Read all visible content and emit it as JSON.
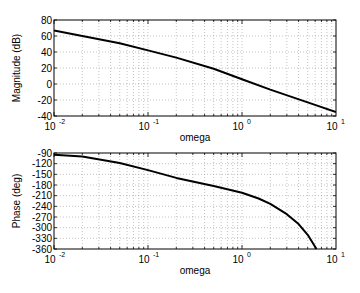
{
  "chart_data": [
    {
      "type": "line",
      "title": "",
      "xlabel": "omega",
      "ylabel": "Magnitude (dB)",
      "xscale": "log",
      "xlim": [
        0.01,
        10
      ],
      "ylim": [
        -40,
        80
      ],
      "grid": true,
      "xticks": [
        "10^-2",
        "10^-1",
        "10^0",
        "10^1"
      ],
      "yticks": [
        80,
        60,
        40,
        20,
        0,
        -20,
        -40
      ],
      "series": [
        {
          "name": "Magnitude",
          "x": [
            0.01,
            0.02,
            0.05,
            0.1,
            0.2,
            0.5,
            1,
            2,
            5,
            10
          ],
          "y": [
            67,
            60,
            51,
            42,
            33,
            19,
            6,
            -7,
            -23,
            -35
          ]
        }
      ]
    },
    {
      "type": "line",
      "title": "",
      "xlabel": "omega",
      "ylabel": "Phase (deg)",
      "xscale": "log",
      "xlim": [
        0.01,
        10
      ],
      "ylim": [
        -360,
        -90
      ],
      "grid": true,
      "xticks": [
        "10^-2",
        "10^-1",
        "10^0",
        "10^1"
      ],
      "yticks": [
        -90,
        -120,
        -150,
        -180,
        -210,
        -240,
        -270,
        -300,
        -330,
        -360
      ],
      "series": [
        {
          "name": "Phase",
          "x": [
            0.01,
            0.02,
            0.05,
            0.1,
            0.2,
            0.5,
            1,
            1.5,
            2,
            3,
            4,
            5,
            6.2
          ],
          "y": [
            -95,
            -100,
            -118,
            -138,
            -160,
            -183,
            -202,
            -218,
            -233,
            -262,
            -290,
            -320,
            -360
          ]
        }
      ]
    }
  ],
  "labels": {
    "top_ylabel": "Magnitude (dB)",
    "bottom_ylabel": "Phase (deg)",
    "top_xlabel": "omega",
    "bottom_xlabel": "omega"
  }
}
